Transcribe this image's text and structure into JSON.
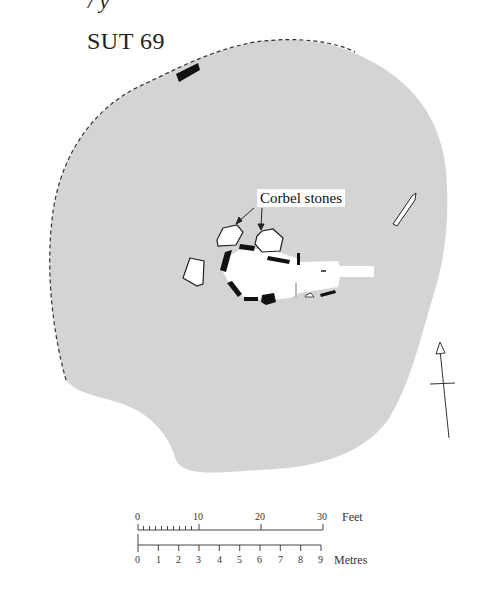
{
  "header": {
    "fragment_text": "/ y",
    "site_title": "SUT 69"
  },
  "annotations": {
    "corbel_label": "Corbel stones"
  },
  "scale_bar": {
    "feet_label": "Feet",
    "feet_ticks": [
      "0",
      "10",
      "20",
      "30"
    ],
    "metres_label": "Metres",
    "metres_ticks": [
      "0",
      "1",
      "2",
      "3",
      "4",
      "5",
      "6",
      "7",
      "8",
      "9"
    ]
  },
  "north_arrow": {
    "direction": "north"
  },
  "colors": {
    "mound_fill": "#d3d3d3",
    "orthostat": "#111111",
    "chamber_floor": "#ffffff",
    "outline": "#333333"
  }
}
